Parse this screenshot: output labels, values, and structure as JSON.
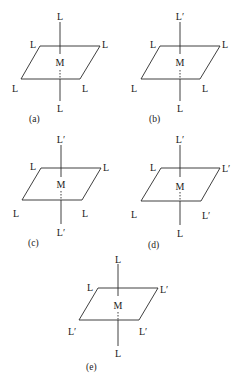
{
  "figure": {
    "center_label": "M",
    "diagrams": [
      {
        "caption": "(a)",
        "top": "L",
        "bottom": "L",
        "plane_top_left": "L",
        "plane_top_right": "L",
        "plane_bottom_left": "L",
        "plane_bottom_right": "L"
      },
      {
        "caption": "(b)",
        "top": "L′",
        "bottom": "L",
        "plane_top_left": "L",
        "plane_top_right": "L",
        "plane_bottom_left": "L",
        "plane_bottom_right": "L"
      },
      {
        "caption": "(c)",
        "top": "L′",
        "bottom": "L′",
        "plane_top_left": "L",
        "plane_top_right": "L",
        "plane_bottom_left": "L",
        "plane_bottom_right": "L"
      },
      {
        "caption": "(d)",
        "top": "L′",
        "bottom": "L",
        "plane_top_left": "L",
        "plane_top_right": "L′",
        "plane_bottom_left": "L",
        "plane_bottom_right": "L′"
      },
      {
        "caption": "(e)",
        "top": "L",
        "bottom": "L",
        "plane_top_left": "L",
        "plane_top_right": "L′",
        "plane_bottom_left": "L′",
        "plane_bottom_right": "L′"
      }
    ]
  }
}
